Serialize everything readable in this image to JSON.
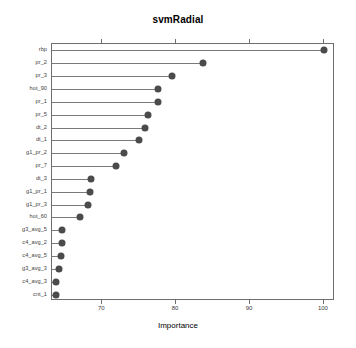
{
  "chart_data": {
    "type": "scatter",
    "title": "svmRadial",
    "xlabel": "Importance",
    "ylabel": "",
    "xlim": [
      63.2,
      101.5
    ],
    "xticks": [
      70,
      80,
      90,
      100
    ],
    "xtick_labels": [
      "70",
      "80",
      "90",
      "100"
    ],
    "grid": false,
    "legend": false,
    "orientation": "horizontal",
    "style": "lollipop-dotplot",
    "marker_color": "#4b4b4b",
    "line_color": "#7a7a7a",
    "categories": [
      "rbp",
      "pr_2",
      "pr_3",
      "hot_90",
      "pr_1",
      "pr_5",
      "dt_2",
      "dt_1",
      "g1_pr_2",
      "pr_7",
      "dt_3",
      "g1_pr_1",
      "g1_pr_3",
      "hot_60",
      "g3_avg_5",
      "c4_avg_2",
      "c4_avg_5",
      "g3_avg_3",
      "c4_avg_3",
      "cnt_1"
    ],
    "values": [
      100.0,
      83.7,
      79.4,
      77.6,
      77.5,
      76.2,
      75.8,
      75.0,
      72.9,
      71.9,
      68.5,
      68.4,
      68.1,
      67.0,
      64.6,
      64.5,
      64.4,
      64.1,
      63.8,
      63.7
    ]
  },
  "chart": {
    "title": "svmRadial",
    "xlabel": "Importance"
  }
}
